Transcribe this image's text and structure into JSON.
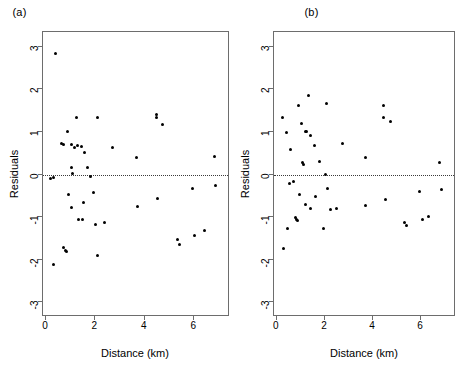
{
  "figure": {
    "panels": [
      {
        "title": "(a)",
        "xlabel": "Distance (km)",
        "ylabel": "Residuals"
      },
      {
        "title": "(b)",
        "xlabel": "Distance (km)",
        "ylabel": "Residuals"
      }
    ],
    "xticklabels": [
      "0",
      "2",
      "4",
      "6"
    ],
    "yticklabels": [
      "3",
      "2",
      "1",
      "0",
      "-1",
      "-2",
      "-3"
    ]
  },
  "chart_data": [
    {
      "type": "scatter",
      "title": "(a)",
      "xlabel": "Distance (km)",
      "ylabel": "Residuals",
      "xlim": [
        -0.12,
        7.45
      ],
      "ylim": [
        -3.35,
        3.35
      ],
      "xticks": [
        0,
        2,
        4,
        6
      ],
      "yticks": [
        3,
        2,
        1,
        0,
        -1,
        -2,
        -3
      ],
      "grid": false,
      "legend": null,
      "annotations": [
        {
          "type": "hline",
          "y": 0,
          "style": "dotted"
        }
      ],
      "points": [
        {
          "x": 0.38,
          "y": 2.84
        },
        {
          "x": 0.18,
          "y": -0.09
        },
        {
          "x": 0.3,
          "y": -0.08
        },
        {
          "x": 0.3,
          "y": -2.11
        },
        {
          "x": 0.63,
          "y": 0.74
        },
        {
          "x": 0.7,
          "y": 0.71
        },
        {
          "x": 0.72,
          "y": -1.72
        },
        {
          "x": 0.78,
          "y": -1.78
        },
        {
          "x": 0.82,
          "y": -1.82
        },
        {
          "x": 0.88,
          "y": 1.0
        },
        {
          "x": 0.92,
          "y": -0.48
        },
        {
          "x": 1.02,
          "y": 0.7
        },
        {
          "x": 1.05,
          "y": 0.17
        },
        {
          "x": 1.07,
          "y": 0.02
        },
        {
          "x": 1.02,
          "y": -0.77
        },
        {
          "x": 1.15,
          "y": 0.64
        },
        {
          "x": 1.22,
          "y": 1.33
        },
        {
          "x": 1.28,
          "y": 0.69
        },
        {
          "x": 1.3,
          "y": -1.06
        },
        {
          "x": 1.42,
          "y": 0.67
        },
        {
          "x": 1.48,
          "y": -1.06
        },
        {
          "x": 1.52,
          "y": -0.66
        },
        {
          "x": 1.58,
          "y": 0.52
        },
        {
          "x": 1.7,
          "y": 0.16
        },
        {
          "x": 1.8,
          "y": -0.04
        },
        {
          "x": 1.92,
          "y": -0.42
        },
        {
          "x": 2.02,
          "y": -1.18
        },
        {
          "x": 2.08,
          "y": 1.33
        },
        {
          "x": 2.1,
          "y": -1.9
        },
        {
          "x": 2.38,
          "y": -1.13
        },
        {
          "x": 2.7,
          "y": 0.63
        },
        {
          "x": 3.68,
          "y": 0.4
        },
        {
          "x": 3.7,
          "y": -0.76
        },
        {
          "x": 4.46,
          "y": 1.4
        },
        {
          "x": 4.48,
          "y": 1.33
        },
        {
          "x": 4.52,
          "y": -0.56
        },
        {
          "x": 4.7,
          "y": 1.18
        },
        {
          "x": 5.32,
          "y": -1.53
        },
        {
          "x": 5.42,
          "y": -1.65
        },
        {
          "x": 5.92,
          "y": -0.34
        },
        {
          "x": 6.0,
          "y": -1.44
        },
        {
          "x": 6.4,
          "y": -1.32
        },
        {
          "x": 6.82,
          "y": 0.43
        },
        {
          "x": 6.88,
          "y": -0.26
        }
      ]
    },
    {
      "type": "scatter",
      "title": "(b)",
      "xlabel": "Distance (km)",
      "ylabel": "Residuals",
      "xlim": [
        -0.12,
        7.45
      ],
      "ylim": [
        -3.35,
        3.35
      ],
      "xticks": [
        0,
        2,
        4,
        6
      ],
      "yticks": [
        3,
        2,
        1,
        0,
        -1,
        -2,
        -3
      ],
      "grid": false,
      "legend": null,
      "annotations": [
        {
          "type": "hline",
          "y": 0,
          "style": "dotted"
        }
      ],
      "points": [
        {
          "x": 0.22,
          "y": 1.35
        },
        {
          "x": 0.28,
          "y": -1.75
        },
        {
          "x": 0.42,
          "y": 0.98
        },
        {
          "x": 0.45,
          "y": -1.28
        },
        {
          "x": 0.52,
          "y": -0.22
        },
        {
          "x": 0.58,
          "y": 0.58
        },
        {
          "x": 0.7,
          "y": -0.16
        },
        {
          "x": 0.78,
          "y": -1.02
        },
        {
          "x": 0.82,
          "y": -1.06
        },
        {
          "x": 0.86,
          "y": -1.09
        },
        {
          "x": 0.88,
          "y": 1.63
        },
        {
          "x": 0.95,
          "y": -0.46
        },
        {
          "x": 1.02,
          "y": 1.2
        },
        {
          "x": 1.08,
          "y": 0.28
        },
        {
          "x": 1.1,
          "y": 0.24
        },
        {
          "x": 1.18,
          "y": 1.02
        },
        {
          "x": 1.22,
          "y": 1.01
        },
        {
          "x": 1.2,
          "y": -0.7
        },
        {
          "x": 1.3,
          "y": 1.86
        },
        {
          "x": 1.38,
          "y": 0.92
        },
        {
          "x": 1.4,
          "y": -0.8
        },
        {
          "x": 1.58,
          "y": 0.69
        },
        {
          "x": 1.62,
          "y": -0.52
        },
        {
          "x": 1.78,
          "y": 0.3
        },
        {
          "x": 1.95,
          "y": -1.28
        },
        {
          "x": 2.02,
          "y": 0.0
        },
        {
          "x": 2.05,
          "y": 1.68
        },
        {
          "x": 2.1,
          "y": -0.33
        },
        {
          "x": 2.22,
          "y": -0.83
        },
        {
          "x": 2.48,
          "y": -0.8
        },
        {
          "x": 2.72,
          "y": 0.74
        },
        {
          "x": 3.68,
          "y": 0.41
        },
        {
          "x": 3.7,
          "y": -0.73
        },
        {
          "x": 4.42,
          "y": 1.63
        },
        {
          "x": 4.42,
          "y": 1.33
        },
        {
          "x": 4.5,
          "y": -0.58
        },
        {
          "x": 4.72,
          "y": 1.24
        },
        {
          "x": 5.3,
          "y": -1.12
        },
        {
          "x": 5.38,
          "y": -1.2
        },
        {
          "x": 5.92,
          "y": -0.4
        },
        {
          "x": 6.05,
          "y": -1.05
        },
        {
          "x": 6.32,
          "y": -0.98
        },
        {
          "x": 6.78,
          "y": 0.29
        },
        {
          "x": 6.85,
          "y": -0.36
        }
      ]
    }
  ]
}
